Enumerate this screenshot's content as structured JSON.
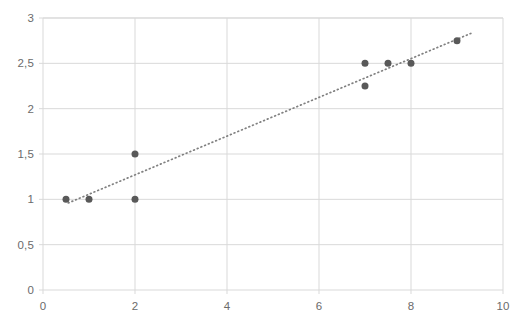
{
  "chart_data": {
    "type": "scatter",
    "title": "",
    "subtitle": "",
    "xlabel": "",
    "ylabel": "",
    "xlim": [
      0,
      10
    ],
    "ylim": [
      0,
      3
    ],
    "grid": true,
    "legend": false,
    "legend_position": "none",
    "x_ticks": [
      "0",
      "2",
      "4",
      "6",
      "8",
      "10"
    ],
    "x_tick_values": [
      0,
      2,
      4,
      6,
      8,
      10
    ],
    "y_ticks": [
      "0",
      "0,5",
      "1",
      "1,5",
      "2",
      "2,5",
      "3"
    ],
    "y_tick_values": [
      0,
      0.5,
      1,
      1.5,
      2,
      2.5,
      3
    ],
    "decimal_separator": ",",
    "marker_color": "#595959",
    "marker_size": 7,
    "grid_color": "#d9d9d9",
    "axis_color": "#d9d9d9",
    "background_color": "#ffffff",
    "series": [
      {
        "name": "data points",
        "type": "scatter",
        "points": [
          {
            "x": 0.5,
            "y": 1.0
          },
          {
            "x": 1.0,
            "y": 1.0
          },
          {
            "x": 2.0,
            "y": 1.0
          },
          {
            "x": 2.0,
            "y": 1.5
          },
          {
            "x": 7.0,
            "y": 2.5
          },
          {
            "x": 7.0,
            "y": 2.25
          },
          {
            "x": 7.5,
            "y": 2.5
          },
          {
            "x": 8.0,
            "y": 2.5
          },
          {
            "x": 9.0,
            "y": 2.75
          }
        ]
      },
      {
        "name": "trendline",
        "type": "line",
        "style": "dotted",
        "color": "#808080",
        "points": [
          {
            "x": 0.55,
            "y": 0.96
          },
          {
            "x": 9.3,
            "y": 2.83
          }
        ]
      }
    ]
  }
}
